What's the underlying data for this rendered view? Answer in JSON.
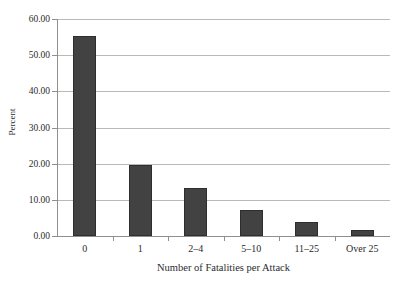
{
  "chart_data": {
    "type": "bar",
    "title": "",
    "xlabel": "Number of Fatalities per Attack",
    "ylabel": "Percent",
    "categories": [
      "0",
      "1",
      "2–4",
      "5–10",
      "11–25",
      "Over 25"
    ],
    "values": [
      55.3,
      19.6,
      13.3,
      7.2,
      3.9,
      1.7
    ],
    "ylim": [
      0,
      60
    ],
    "ytick_labels": [
      "0.00",
      "10.00",
      "20.00",
      "30.00",
      "40.00",
      "50.00",
      "60.00"
    ],
    "ytick_values": [
      0,
      10,
      20,
      30,
      40,
      50,
      60
    ],
    "grid": true,
    "legend": "none",
    "bar_color": "#424242",
    "grid_color": "#b9b9b9",
    "axis_color": "#8f8f8f",
    "background": "#ffffff"
  }
}
